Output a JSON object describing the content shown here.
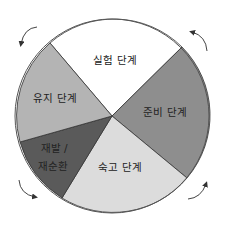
{
  "diagram": {
    "type": "cycle-wheel",
    "center": [
      112,
      116
    ],
    "radius": 98,
    "segments": [
      {
        "id": "experiment",
        "label": "실험 단계",
        "color": "#ffffff",
        "from": [
          50,
          43
        ],
        "to": [
          182,
          47
        ],
        "label_pos": [
          115,
          62
        ]
      },
      {
        "id": "preparation",
        "label": "준비 단계",
        "color": "#8e8e8e",
        "from": [
          182,
          47
        ],
        "to": [
          187,
          178
        ],
        "label_pos": [
          165,
          113
        ]
      },
      {
        "id": "contemplation",
        "label": "숙고 단계",
        "color": "#dcdcdc",
        "from": [
          187,
          178
        ],
        "to": [
          62,
          198
        ],
        "label_pos": [
          120,
          168
        ]
      },
      {
        "id": "relapse",
        "label_line1": "재발 /",
        "label_line2": "재순환",
        "color": "#5a5a5a",
        "from": [
          62,
          198
        ],
        "to": [
          20,
          142
        ]
      },
      {
        "id": "maintenance",
        "label": "유지 단계",
        "color": "#b4b4b4",
        "from": [
          20,
          142
        ],
        "to": [
          50,
          43
        ],
        "label_pos": [
          55,
          99
        ]
      }
    ],
    "arrows": [
      {
        "position": "top-left",
        "direction": "counter-clockwise"
      },
      {
        "position": "top-right",
        "direction": "counter-clockwise"
      },
      {
        "position": "bottom-right",
        "direction": "counter-clockwise"
      },
      {
        "position": "bottom-left",
        "direction": "counter-clockwise"
      }
    ]
  }
}
